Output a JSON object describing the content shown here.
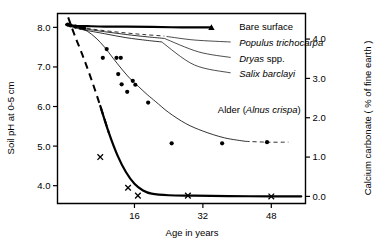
{
  "chart_data": {
    "type": "line",
    "title": "",
    "xlabel": "Age in years",
    "ylabel": "Soil pH at 0-5 cm",
    "y2label": "Calcium carbonate ( % of fine earth )",
    "xlim": [
      -2,
      56
    ],
    "ylim": [
      3.55,
      8.35
    ],
    "y2lim": [
      -0.18,
      4.65
    ],
    "grid": false,
    "legend_position": "inline-annotations-with-leader-lines",
    "xticks": [
      16,
      32,
      48
    ],
    "xtick_labels": [
      "16",
      "32",
      "48"
    ],
    "yticks": [
      4.0,
      5.0,
      6.0,
      7.0,
      8.0
    ],
    "ytick_labels": [
      "4.0",
      "5.0",
      "6.0",
      "7.0",
      "8.0"
    ],
    "y2ticks": [
      0.0,
      1.0,
      2.0,
      3.0,
      4.0
    ],
    "y2tick_labels": [
      "0.0",
      "1.0",
      "2.0",
      "3.0",
      "4.0"
    ],
    "series": [
      {
        "name": "Bare surface",
        "label_parts": [
          {
            "text": "Bare surface",
            "italic": false
          }
        ],
        "axis": "left",
        "style": "thick-solid",
        "marker": "triangle",
        "label_x": 40.5,
        "label_y": 8.03,
        "leader": [],
        "x": [
          0,
          2,
          5,
          9,
          14,
          20,
          27,
          34
        ],
        "y": [
          8.07,
          8.04,
          8.03,
          8.02,
          8.02,
          8.01,
          8.0,
          8.0
        ]
      },
      {
        "name": "Populus trichocarpa",
        "label_parts": [
          {
            "text": "Populus trichocarpa",
            "italic": true
          }
        ],
        "axis": "left",
        "style": "thin-dashed",
        "marker": "dot",
        "label_x": 40.5,
        "label_y": 7.62,
        "leader": [
          [
            23.5,
            7.77
          ],
          [
            30,
            7.68
          ],
          [
            38.5,
            7.63
          ]
        ],
        "x": [
          0,
          4,
          8,
          13,
          18,
          23
        ],
        "y": [
          8.06,
          7.99,
          7.93,
          7.87,
          7.82,
          7.78
        ]
      },
      {
        "name": "Dryas spp.",
        "label_parts": [
          {
            "text": "Dryas",
            "italic": true
          },
          {
            "text": " spp.",
            "italic": false
          }
        ],
        "axis": "left",
        "style": "thin-solid",
        "marker": "dot",
        "label_x": 40.5,
        "label_y": 7.22,
        "leader": [
          [
            23.0,
            7.72
          ],
          [
            31,
            7.38
          ],
          [
            38.5,
            7.24
          ]
        ],
        "x": [
          0,
          4,
          9,
          14,
          19,
          23
        ],
        "y": [
          8.06,
          7.97,
          7.89,
          7.82,
          7.76,
          7.72
        ]
      },
      {
        "name": "Salix barclayi",
        "label_parts": [
          {
            "text": "Salix barclayi",
            "italic": true
          }
        ],
        "axis": "left",
        "style": "thin-solid",
        "marker": "dot",
        "label_x": 40.5,
        "label_y": 6.82,
        "leader": [
          [
            22.5,
            7.62
          ],
          [
            30,
            7.05
          ],
          [
            38.5,
            6.85
          ]
        ],
        "x": [
          0,
          4,
          9,
          14,
          19,
          22.5
        ],
        "y": [
          8.05,
          7.94,
          7.84,
          7.74,
          7.67,
          7.63
        ]
      },
      {
        "name": "Alder (Alnus crispa)",
        "label_parts": [
          {
            "text": "Alder (",
            "italic": false
          },
          {
            "text": "Alnus crispa",
            "italic": true
          },
          {
            "text": ")",
            "italic": false
          }
        ],
        "axis": "left",
        "style": "thin-solid",
        "marker": "dot",
        "label_x": 35.5,
        "label_y": 5.93,
        "leader": [],
        "x": [
          1,
          3,
          5,
          7,
          9,
          11,
          13,
          15,
          17,
          19,
          21,
          24,
          28,
          32,
          37,
          42,
          47,
          52
        ],
        "y": [
          8.06,
          8.0,
          7.9,
          7.73,
          7.5,
          7.22,
          6.95,
          6.7,
          6.5,
          6.3,
          6.12,
          5.85,
          5.57,
          5.38,
          5.21,
          5.12,
          5.1,
          5.1
        ],
        "points": [
          [
            0.4,
            8.07
          ],
          [
            1.0,
            8.05
          ],
          [
            2.2,
            8.02
          ],
          [
            3.4,
            7.99
          ],
          [
            4.2,
            7.98
          ],
          [
            8.6,
            7.23
          ],
          [
            9.5,
            7.45
          ],
          [
            11.8,
            7.23
          ],
          [
            12.8,
            7.23
          ],
          [
            12.2,
            6.82
          ],
          [
            13.0,
            6.56
          ],
          [
            14.3,
            6.37
          ],
          [
            15.6,
            6.65
          ],
          [
            16.2,
            6.55
          ],
          [
            19.2,
            6.1
          ],
          [
            24.7,
            5.07
          ],
          [
            36.5,
            5.07
          ],
          [
            47.0,
            5.1
          ]
        ],
        "tail_dashed": true
      },
      {
        "name": "Calcium carbonate",
        "label_parts": [],
        "axis": "right",
        "style": "thick-solid-with-dashed-head",
        "marker": "x",
        "label_x": null,
        "label_y": null,
        "leader": [],
        "x": [
          0.5,
          2,
          4,
          6,
          8,
          10,
          12,
          14,
          16,
          18,
          20,
          24,
          30,
          38,
          48,
          55
        ],
        "y": [
          4.55,
          4.1,
          3.55,
          2.95,
          2.3,
          1.62,
          1.05,
          0.62,
          0.32,
          0.15,
          0.07,
          0.03,
          0.02,
          0.01,
          0.0,
          0.0
        ],
        "points": [
          [
            8.0,
            1.0
          ],
          [
            14.5,
            0.22
          ],
          [
            16.8,
            0.02
          ],
          [
            28.5,
            0.02
          ],
          [
            48.0,
            0.0
          ]
        ]
      }
    ]
  }
}
